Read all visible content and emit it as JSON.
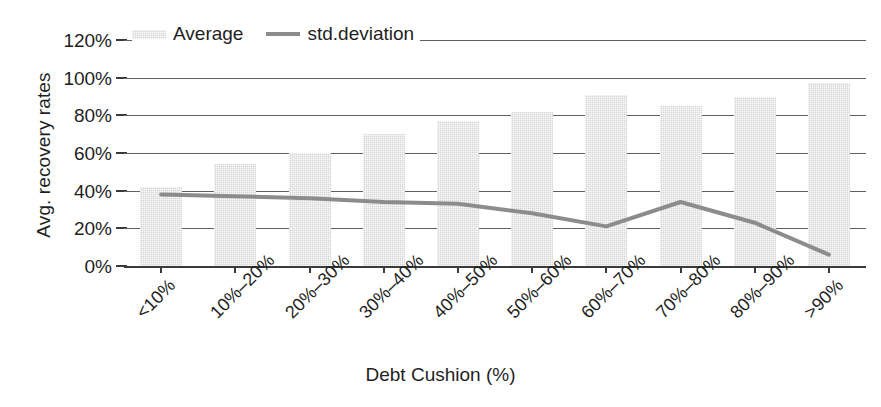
{
  "chart_data": {
    "type": "bar",
    "title": "",
    "xlabel": "Debt Cushion (%)",
    "ylabel": "Avg. recovery rates",
    "categories": [
      "<10%",
      "10%–20%",
      "20%–30%",
      "30%–40%",
      "40%–50%",
      "50%–60%",
      "60%–70%",
      "70%–80%",
      "80%–90%",
      ">90%"
    ],
    "ylim": [
      0,
      120
    ],
    "ytick_labels": [
      "120%",
      "100%",
      "80%",
      "60%",
      "40%",
      "20%",
      "0%"
    ],
    "ytick_values": [
      120,
      100,
      80,
      60,
      40,
      20,
      0
    ],
    "grid": true,
    "legend_position": "top-left",
    "series": [
      {
        "name": "Average",
        "type": "bar",
        "color": "#d6d6d6",
        "values": [
          42,
          54,
          60,
          70,
          77,
          82,
          91,
          85,
          90,
          97
        ]
      },
      {
        "name": "std.deviation",
        "type": "line",
        "color": "#8c8c8c",
        "values": [
          38,
          37,
          36,
          34,
          33,
          28,
          21,
          34,
          23,
          6
        ]
      }
    ]
  },
  "legend": {
    "items": [
      {
        "label": "Average",
        "icon": "bar-swatch"
      },
      {
        "label": "std.deviation",
        "icon": "line-swatch"
      }
    ]
  }
}
